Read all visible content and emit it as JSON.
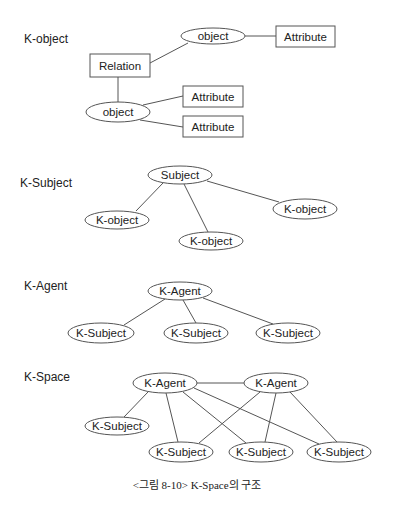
{
  "diagram": {
    "caption": "<그림 8-10> K-Space의 구조",
    "stroke_color": "#555555",
    "sections": [
      {
        "id": "k-object",
        "label": "K-object",
        "label_pos": [
          24,
          43
        ],
        "nodes": [
          {
            "id": "obj1",
            "shape": "ellipse",
            "text": "object",
            "cx": 213,
            "cy": 36,
            "rx": 32,
            "ry": 8
          },
          {
            "id": "attr1",
            "shape": "rect",
            "text": "Attribute",
            "x": 276,
            "y": 26,
            "w": 59,
            "h": 21
          },
          {
            "id": "rel",
            "shape": "rect",
            "text": "Relation",
            "x": 90,
            "y": 54,
            "w": 60,
            "h": 23
          },
          {
            "id": "obj2",
            "shape": "ellipse",
            "text": "object",
            "cx": 118,
            "cy": 112,
            "rx": 32,
            "ry": 10
          },
          {
            "id": "attr2",
            "shape": "rect",
            "text": "Attribute",
            "x": 183,
            "y": 86,
            "w": 60,
            "h": 21
          },
          {
            "id": "attr3",
            "shape": "rect",
            "text": "Attribute",
            "x": 183,
            "y": 116,
            "w": 60,
            "h": 21
          }
        ],
        "edges": [
          {
            "from": "rel",
            "to": "obj1",
            "points": [
              150,
              63,
              188,
              43
            ]
          },
          {
            "from": "obj1",
            "to": "attr1",
            "points": [
              245,
              36,
              276,
              36
            ]
          },
          {
            "from": "rel",
            "to": "obj2",
            "points": [
              118,
              77,
              118,
              102
            ]
          },
          {
            "from": "obj2",
            "to": "attr2",
            "points": [
              143,
              105,
              183,
              96
            ]
          },
          {
            "from": "obj2",
            "to": "attr3",
            "points": [
              140,
              120,
              183,
              127
            ]
          }
        ]
      },
      {
        "id": "k-subject",
        "label": "K-Subject",
        "label_pos": [
          20,
          187
        ],
        "nodes": [
          {
            "id": "subj",
            "shape": "ellipse",
            "text": "Subject",
            "cx": 180,
            "cy": 175,
            "rx": 32,
            "ry": 9
          },
          {
            "id": "ko1",
            "shape": "ellipse",
            "text": "K-object",
            "cx": 117,
            "cy": 220,
            "rx": 32,
            "ry": 9
          },
          {
            "id": "ko2",
            "shape": "ellipse",
            "text": "K-object",
            "cx": 211,
            "cy": 241,
            "rx": 32,
            "ry": 9
          },
          {
            "id": "ko3",
            "shape": "ellipse",
            "text": "K-object",
            "cx": 305,
            "cy": 209,
            "rx": 32,
            "ry": 10
          }
        ],
        "edges": [
          {
            "from": "subj",
            "to": "ko1",
            "points": [
              163,
              183,
              136,
              211
            ]
          },
          {
            "from": "subj",
            "to": "ko2",
            "points": [
              184,
              184,
              208,
              232
            ]
          },
          {
            "from": "subj",
            "to": "ko3",
            "points": [
              207,
              181,
              279,
              202
            ]
          }
        ]
      },
      {
        "id": "k-agent",
        "label": "K-Agent",
        "label_pos": [
          24,
          290
        ],
        "nodes": [
          {
            "id": "agent",
            "shape": "ellipse",
            "text": "K-Agent",
            "cx": 180,
            "cy": 291,
            "rx": 32,
            "ry": 9
          },
          {
            "id": "ks1",
            "shape": "ellipse",
            "text": "K-Subject",
            "cx": 101,
            "cy": 333,
            "rx": 33,
            "ry": 10
          },
          {
            "id": "ks2",
            "shape": "ellipse",
            "text": "K-Subject",
            "cx": 196,
            "cy": 333,
            "rx": 32,
            "ry": 10
          },
          {
            "id": "ks3",
            "shape": "ellipse",
            "text": "K-Subject",
            "cx": 288,
            "cy": 333,
            "rx": 32,
            "ry": 10
          }
        ],
        "edges": [
          {
            "from": "agent",
            "to": "ks1",
            "points": [
              165,
              299,
              124,
              325
            ]
          },
          {
            "from": "agent",
            "to": "ks2",
            "points": [
              183,
              300,
              196,
              323
            ]
          },
          {
            "from": "agent",
            "to": "ks3",
            "points": [
              203,
              298,
              273,
              324
            ]
          }
        ]
      },
      {
        "id": "k-space",
        "label": "K-Space",
        "label_pos": [
          24,
          381
        ],
        "nodes": [
          {
            "id": "ag1",
            "shape": "ellipse",
            "text": "K-Agent",
            "cx": 165,
            "cy": 383,
            "rx": 32,
            "ry": 10
          },
          {
            "id": "ag2",
            "shape": "ellipse",
            "text": "K-Agent",
            "cx": 276,
            "cy": 383,
            "rx": 32,
            "ry": 10
          },
          {
            "id": "s1",
            "shape": "ellipse",
            "text": "K-Subject",
            "cx": 117,
            "cy": 426,
            "rx": 32,
            "ry": 9
          },
          {
            "id": "s2",
            "shape": "ellipse",
            "text": "K-Subject",
            "cx": 181,
            "cy": 452,
            "rx": 32,
            "ry": 10
          },
          {
            "id": "s3",
            "shape": "ellipse",
            "text": "K-Subject",
            "cx": 261,
            "cy": 452,
            "rx": 32,
            "ry": 10
          },
          {
            "id": "s4",
            "shape": "ellipse",
            "text": "K-Subject",
            "cx": 339,
            "cy": 452,
            "rx": 32,
            "ry": 10
          }
        ],
        "edges": [
          {
            "from": "ag1",
            "to": "ag2",
            "points": [
              197,
              383,
              244,
              383
            ]
          },
          {
            "from": "ag1",
            "to": "s1",
            "points": [
              148,
              392,
              124,
              417
            ]
          },
          {
            "from": "ag1",
            "to": "s2",
            "points": [
              166,
              393,
              178,
              442
            ]
          },
          {
            "from": "ag1",
            "to": "s3",
            "points": [
              183,
              392,
              246,
              443
            ]
          },
          {
            "from": "ag1",
            "to": "s4",
            "points": [
              194,
              388,
              319,
              444
            ]
          },
          {
            "from": "ag2",
            "to": "s2",
            "points": [
              260,
              392,
              199,
              443
            ]
          },
          {
            "from": "ag2",
            "to": "s3",
            "points": [
              276,
              393,
              265,
              442
            ]
          },
          {
            "from": "ag2",
            "to": "s4",
            "points": [
              290,
              392,
              337,
              442
            ]
          }
        ]
      }
    ]
  }
}
